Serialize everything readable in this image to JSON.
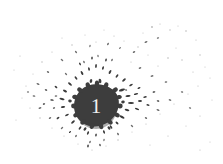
{
  "artwork": {
    "type": "ink-splatter-numeral",
    "title": "Ink splatter with numeral",
    "numeral": "1",
    "canvas": {
      "width": 223,
      "height": 164,
      "background_color": "#ffffff"
    },
    "blob": {
      "center_x": 96,
      "center_y": 106,
      "radius_x": 20,
      "radius_y": 21.5,
      "fill_color": "#3d3d3d",
      "edge_color": "#4a4a4a"
    },
    "numeral_style": {
      "text_color": "#f2f2f2",
      "font_size_px": 21,
      "font_style": "serif"
    },
    "droplet_color": "#3a3a3a",
    "droplet_color_light": "#8a8a8a",
    "droplet_count_label": "dense near center, sparse at edges"
  }
}
